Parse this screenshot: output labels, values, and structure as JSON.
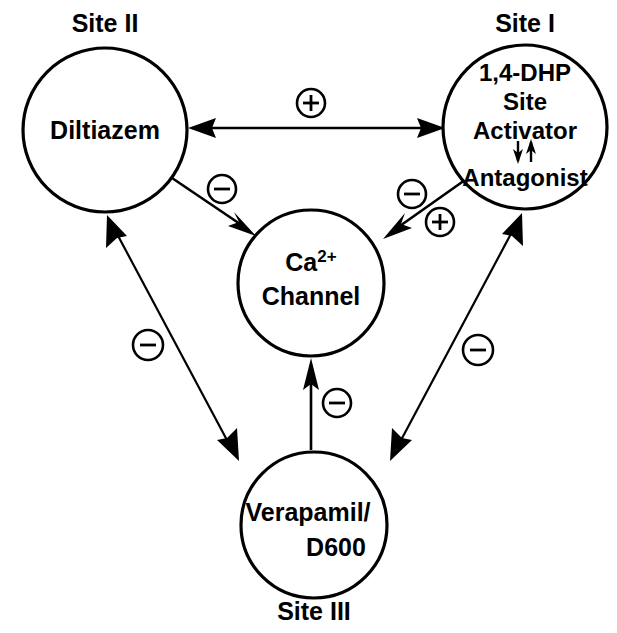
{
  "diagram": {
    "type": "node-link-diagram",
    "canvas": {
      "width": 617,
      "height": 633
    },
    "background_color": "#ffffff",
    "stroke_color": "#000000"
  },
  "nodes": [
    {
      "id": "site2",
      "site_label": "Site II",
      "site_label_position": "above",
      "lines": [
        "Diltiazem"
      ],
      "line1": "Diltiazem",
      "cx": 105,
      "cy": 130,
      "r": 82,
      "font_size": 25
    },
    {
      "id": "site1",
      "site_label": "Site I",
      "site_label_position": "above",
      "lines": [
        "1,4-DHP",
        "Site",
        "Activator",
        "⇅",
        "Antagonist"
      ],
      "line1": "1,4-DHP",
      "line2": "Site",
      "line3": "Activator",
      "line4": "⇅",
      "line5": "Antagonist",
      "cx": 525,
      "cy": 127,
      "r": 82,
      "font_size": 24
    },
    {
      "id": "channel",
      "site_label": "",
      "lines": [
        "Ca2+",
        "Channel"
      ],
      "line1_base": "Ca",
      "line1_sup": "2+",
      "line2": "Channel",
      "cx": 311,
      "cy": 283,
      "r": 73,
      "font_size": 25
    },
    {
      "id": "site3",
      "site_label": "Site III",
      "site_label_position": "below",
      "lines": [
        "Verapamil/",
        "D600"
      ],
      "line1": "Verapamil/",
      "line2": "D600",
      "cx": 314,
      "cy": 525,
      "r": 73,
      "font_size": 25
    }
  ],
  "edges": [
    {
      "id": "site2-site1",
      "from": "site2",
      "to": "site1",
      "arrow": "double",
      "orientation": "horizontal",
      "badges": [
        {
          "sign": "+",
          "symbol": "⊕",
          "x": 311,
          "y": 103
        }
      ]
    },
    {
      "id": "site2-channel",
      "from": "site2",
      "to": "channel",
      "arrow": "single",
      "orientation": "diagonal-down-right",
      "badges": [
        {
          "sign": "-",
          "symbol": "⊖",
          "x": 222,
          "y": 189
        }
      ]
    },
    {
      "id": "site1-channel",
      "from": "site1",
      "to": "channel",
      "arrow": "single",
      "orientation": "diagonal-down-left",
      "badges": [
        {
          "sign": "-",
          "symbol": "⊖",
          "x": 412,
          "y": 194
        },
        {
          "sign": "+",
          "symbol": "⊕",
          "x": 439,
          "y": 222
        }
      ]
    },
    {
      "id": "site3-channel",
      "from": "site3",
      "to": "channel",
      "arrow": "single",
      "orientation": "vertical-up",
      "badges": [
        {
          "sign": "-",
          "symbol": "⊖",
          "x": 337,
          "y": 403
        }
      ]
    },
    {
      "id": "site2-site3",
      "from": "site2",
      "to": "site3",
      "arrow": "double",
      "orientation": "diagonal-left",
      "badges": [
        {
          "sign": "-",
          "symbol": "⊖",
          "x": 148,
          "y": 345
        }
      ]
    },
    {
      "id": "site1-site3",
      "from": "site1",
      "to": "site3",
      "arrow": "double",
      "orientation": "diagonal-right",
      "badges": [
        {
          "sign": "-",
          "symbol": "⊖",
          "x": 478,
          "y": 350
        }
      ]
    }
  ],
  "legend_signs": {
    "plus_meaning": "+",
    "minus_meaning": "-"
  }
}
